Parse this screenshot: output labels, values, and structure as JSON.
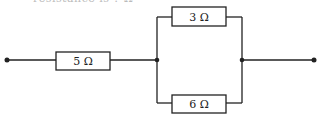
{
  "caption_fragment": "resistance is ? Ω",
  "circuit": {
    "resistors": [
      {
        "id": "R1",
        "label": "5 Ω",
        "position": "series"
      },
      {
        "id": "R2",
        "label": "3 Ω",
        "position": "parallel-top"
      },
      {
        "id": "R3",
        "label": "6 Ω",
        "position": "parallel-bottom"
      }
    ],
    "terminals": [
      "left",
      "right"
    ],
    "colors": {
      "line": "#222222",
      "background": "#ffffff"
    }
  }
}
